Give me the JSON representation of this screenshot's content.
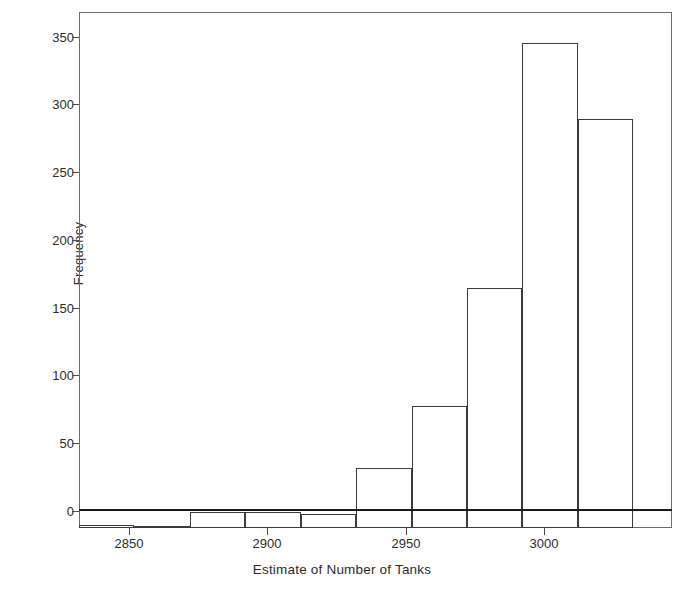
{
  "figure": {
    "background_color": "#ffffff",
    "frame_color": "#6b6b6b",
    "bar_edge_color": "#3a3a3a",
    "bar_fill_color": "#ffffff"
  },
  "axes": {
    "y_title": "Frequency",
    "x_title": "Estimate of Number of Tanks",
    "y_ticks": [
      "0",
      "50",
      "100",
      "150",
      "200",
      "250",
      "300",
      "350"
    ],
    "x_ticks": [
      "2850",
      "2900",
      "2950",
      "3000"
    ]
  },
  "chart_data": {
    "type": "bar",
    "title": "",
    "subtitle": "",
    "xlabel": "Estimate of Number of Tanks",
    "ylabel": "Frequency",
    "xlim": [
      2838,
      3052
    ],
    "ylim": [
      0,
      381
    ],
    "grid": false,
    "legend": null,
    "bin_width": 20,
    "bin_edges": [
      2838,
      2858,
      2878,
      2898,
      2918,
      2938,
      2958,
      2978,
      2998,
      3018,
      3038
    ],
    "bin_centers": [
      2848,
      2868,
      2888,
      2908,
      2928,
      2948,
      2968,
      2988,
      3008,
      3028
    ],
    "categories": [
      "2838-2858",
      "2858-2878",
      "2878-2898",
      "2898-2918",
      "2918-2938",
      "2938-2958",
      "2958-2978",
      "2978-2998",
      "2998-3018",
      "3018-3038"
    ],
    "values": [
      2,
      1,
      12,
      12,
      10,
      44,
      90,
      177,
      358,
      302
    ],
    "series": [
      {
        "name": "Frequency",
        "values": [
          2,
          1,
          12,
          12,
          10,
          44,
          90,
          177,
          358,
          302
        ]
      }
    ]
  }
}
